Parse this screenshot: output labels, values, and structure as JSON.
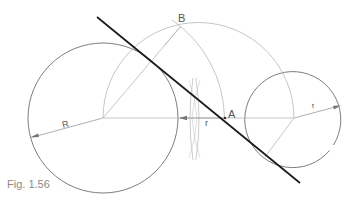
{
  "figure": {
    "caption": "Fig. 1.56",
    "labels": {
      "point_b": "B",
      "point_a": "A",
      "radius_large": "R",
      "radius_small_offset": "r",
      "radius_small": "r"
    },
    "colors": {
      "tangent_line": "#1a1a1a",
      "circle_outline": "#6e6e6e",
      "construction": "#b8b8b8",
      "caption": "#8a8a8a"
    }
  }
}
